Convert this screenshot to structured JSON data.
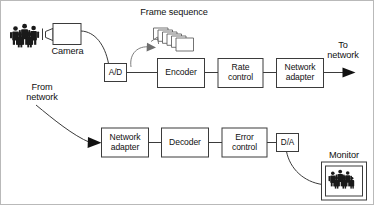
{
  "diagram": {
    "background_color": "#ffffff",
    "line_color": "#3b3b3b",
    "text_color": "#111111",
    "border_color": "#b9b9b9",
    "labels": {
      "frame_sequence": "Frame sequence",
      "camera": "Camera",
      "to_network": "To\nnetwork",
      "from_network": "From\nnetwork",
      "monitor": "Monitor"
    },
    "blocks": {
      "ad": "A/D",
      "encoder": "Encoder",
      "rate_control": "Rate\ncontrol",
      "network_adapter_tx": "Network\nadapter",
      "network_adapter_rx": "Network\nadapter",
      "decoder": "Decoder",
      "error_control": "Error\ncontrol",
      "da": "D/A"
    },
    "icons": {
      "people_source": "people-group-icon",
      "camera": "camera-icon",
      "frames": "frame-stack-icon",
      "rotate": "curved-rotate-arrow-icon",
      "monitor": "monitor-icon",
      "people_monitor": "people-group-icon",
      "arrow_to_network": "arrow-right-icon",
      "arrow_from_network": "arrow-right-icon"
    },
    "flow": {
      "transmit_chain": [
        "A/D",
        "Encoder",
        "Rate control",
        "Network adapter"
      ],
      "receive_chain": [
        "Network adapter",
        "Decoder",
        "Error control",
        "D/A"
      ]
    }
  }
}
